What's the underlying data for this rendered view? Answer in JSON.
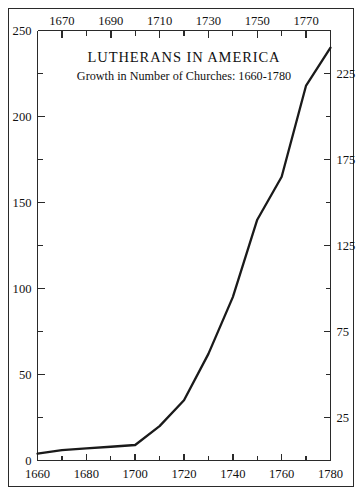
{
  "chart_data": {
    "type": "line",
    "title": "LUTHERANS IN AMERICA",
    "subtitle": "Growth in Number of Churches: 1660-1780",
    "xlabel": "",
    "ylabel": "",
    "xlim": [
      1660,
      1780
    ],
    "ylim": [
      0,
      250
    ],
    "grid": false,
    "legend": null,
    "x": [
      1660,
      1670,
      1680,
      1690,
      1700,
      1710,
      1720,
      1730,
      1740,
      1750,
      1760,
      1770,
      1780
    ],
    "values": [
      4,
      6,
      7,
      8,
      9,
      20,
      35,
      62,
      95,
      140,
      165,
      218,
      240
    ],
    "series": [
      {
        "name": "Number of Churches",
        "values": [
          4,
          6,
          7,
          8,
          9,
          20,
          35,
          62,
          95,
          140,
          165,
          218,
          240
        ],
        "color": "#1a1a1a"
      }
    ],
    "axes": {
      "bottom": {
        "ticks": [
          1660,
          1680,
          1700,
          1720,
          1740,
          1760,
          1780
        ],
        "tick_labels": [
          "1660",
          "1680",
          "1700",
          "1720",
          "1740",
          "1760",
          "1780"
        ],
        "minor_ticks": [
          1670,
          1690,
          1710,
          1730,
          1750,
          1770
        ]
      },
      "top": {
        "ticks": [
          1670,
          1690,
          1710,
          1730,
          1750,
          1770
        ],
        "tick_labels": [
          "1670",
          "1690",
          "1710",
          "1730",
          "1750",
          "1770"
        ],
        "minor_ticks": [
          1660,
          1680,
          1700,
          1720,
          1740,
          1760,
          1780
        ]
      },
      "left": {
        "ticks": [
          0,
          50,
          100,
          150,
          200,
          250
        ],
        "tick_labels": [
          "0",
          "50",
          "100",
          "150",
          "200",
          "250"
        ],
        "minor_ticks": [
          25,
          75,
          125,
          175,
          225
        ]
      },
      "right": {
        "ticks": [
          25,
          75,
          125,
          175,
          225
        ],
        "tick_labels": [
          "25",
          "75",
          "125",
          "175",
          "225"
        ],
        "minor_ticks": [
          0,
          50,
          100,
          150,
          200,
          250
        ]
      }
    },
    "colors": {
      "line": "#1a1a1a",
      "axis": "#2a2a2a",
      "frame": "#2a2a2a",
      "text": "#111111",
      "background": "#ffffff"
    }
  }
}
